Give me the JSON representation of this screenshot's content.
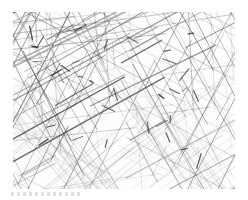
{
  "page": {
    "background_color": "#ffffff",
    "width": 248,
    "height": 200
  },
  "artwork": {
    "title": "Crosshatch Pencil Study",
    "medium": "graphite pencil on paper",
    "subject": "abstract field of overlapping straight strokes",
    "paper_color": "#fdfdfc",
    "stroke_color": "#4a4a4a",
    "stroke_color_light": "#9d9d9d",
    "stroke_color_dark": "#2b2b2b",
    "frame": {
      "left": 13,
      "top": 12,
      "width": 222,
      "height": 177
    },
    "description": "Dense hand-drawn crosshatching of many straight ruled-looking pencil lines crossing at varied angles; darkest and most tangled toward the upper left, opening into lighter regular square grids at the lower left and lower right corners.",
    "regions": [
      {
        "name": "upper-left",
        "density": "very dense",
        "tone": "dark"
      },
      {
        "name": "upper-right",
        "density": "dense",
        "tone": "medium"
      },
      {
        "name": "center",
        "density": "medium",
        "tone": "medium"
      },
      {
        "name": "lower-left",
        "density": "regular grid",
        "tone": "light"
      },
      {
        "name": "lower-right",
        "density": "regular grid",
        "tone": "light"
      }
    ],
    "stroke_families": [
      {
        "name": "steep-left-diagonal",
        "angle_deg": 118,
        "count": 46,
        "weight": "medium"
      },
      {
        "name": "steep-right-diagonal",
        "angle_deg": 62,
        "count": 44,
        "weight": "medium"
      },
      {
        "name": "shallow-right-diagonal",
        "angle_deg": 28,
        "count": 40,
        "weight": "heavy"
      },
      {
        "name": "shallow-left-diagonal",
        "angle_deg": 152,
        "count": 34,
        "weight": "light"
      },
      {
        "name": "near-horizontal",
        "angle_deg": 8,
        "count": 26,
        "weight": "light"
      },
      {
        "name": "near-vertical",
        "angle_deg": 94,
        "count": 24,
        "weight": "light"
      },
      {
        "name": "grid-warp-lower-left",
        "angle_deg": 40,
        "count": 22,
        "weight": "light"
      },
      {
        "name": "grid-weft-lower-left",
        "angle_deg": 130,
        "count": 22,
        "weight": "light"
      },
      {
        "name": "grid-warp-lower-right",
        "angle_deg": 36,
        "count": 18,
        "weight": "light"
      },
      {
        "name": "grid-weft-lower-right",
        "angle_deg": 126,
        "count": 18,
        "weight": "light"
      }
    ]
  },
  "caption": {
    "text": "",
    "legible": false,
    "note": "faint illegible mark below lower-left of the drawing"
  }
}
